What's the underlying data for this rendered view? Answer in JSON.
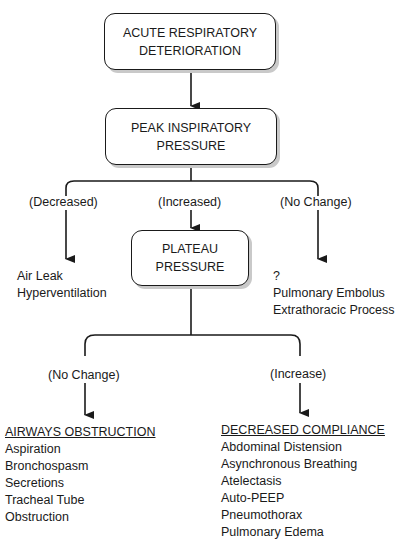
{
  "nodes": {
    "root": {
      "line1": "ACUTE RESPIRATORY",
      "line2": "DETERIORATION"
    },
    "peak": {
      "line1": "PEAK INSPIRATORY",
      "line2": "PRESSURE"
    },
    "plateau": {
      "line1": "PLATEAU",
      "line2": "PRESSURE"
    }
  },
  "peak_branches": {
    "decreased": {
      "label": "(Decreased)",
      "items": [
        "Air Leak",
        "Hyperventilation"
      ]
    },
    "increased": {
      "label": "(Increased)"
    },
    "no_change": {
      "label": "(No Change)",
      "items": [
        "?",
        "Pulmonary Embolus",
        "Extrathoracic Process"
      ]
    }
  },
  "plateau_branches": {
    "no_change": {
      "label": "(No Change)",
      "heading": "AIRWAYS OBSTRUCTION",
      "items": [
        "Aspiration",
        "Bronchospasm",
        "Secretions",
        "Tracheal Tube",
        "Obstruction"
      ]
    },
    "increase": {
      "label": "(Increase)",
      "heading": "DECREASED COMPLIANCE",
      "items": [
        "Abdominal Distension",
        "Asynchronous Breathing",
        "Atelectasis",
        "Auto-PEEP",
        "Pneumothorax",
        "Pulmonary Edema"
      ]
    }
  }
}
